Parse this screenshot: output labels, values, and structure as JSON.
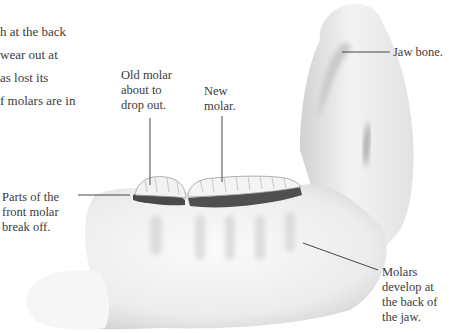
{
  "body_text": {
    "lines": [
      "h at the back",
      " wear out at",
      "as lost its",
      "f molars are in"
    ]
  },
  "labels": {
    "old_molar": "Old molar\nabout to\ndrop out.",
    "new_molar": "New\nmolar.",
    "jaw_bone": "Jaw bone.",
    "front_molar": "Parts of the\nfront molar\nbreak off.",
    "molars_develop": "Molars\ndevelop at\nthe back of\nthe jaw."
  },
  "colors": {
    "bone_light": "#f4f4f4",
    "bone_shadow": "#c8c8c8",
    "gum_dark": "#4a4a4a",
    "leader_line": "#333333"
  }
}
